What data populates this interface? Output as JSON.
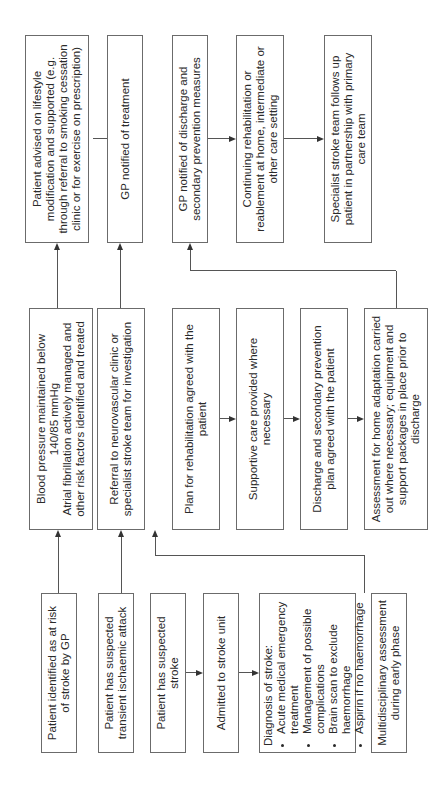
{
  "diagram": {
    "orientation": "rotated -90 degrees (text reads bottom-to-top)",
    "column_1": {
      "at_risk": "Patient identified as at risk of stroke by GP",
      "tia": "Patient has suspected transient ischaemic attack",
      "suspected_stroke": "Patient has suspected stroke",
      "admitted": "Admitted to stroke unit",
      "diagnosis": {
        "title": "Diagnosis of stroke:",
        "bullets": [
          "Acute medical emergency treatment",
          "Management of possible complications",
          "Brain scan to exclude haemorrhage",
          "Aspirin if no haemorrhage"
        ]
      },
      "mdt": "Multidisciplinary assessment during early phase"
    },
    "column_2": {
      "bp": {
        "line1": "Blood pressure maintained below 140/85 mmHg",
        "line2": "Atrial fibrillation actively managed and other risk factors identified and treated"
      },
      "referral": "Referral to neurovascular clinic or specialist stroke team for investigation",
      "rehab_plan": "Plan for rehabilitation agreed with the patient",
      "supportive": "Supportive care provided where necessary",
      "discharge_plan": "Discharge and secondary prevention plan agreed with the patient",
      "home_assessment": "Assessment for home adaptation carried out where necessary; equipment and support packages in place prior to discharge"
    },
    "column_3": {
      "lifestyle": "Patient advised on lifestyle modification and supported (e.g. through referral to smoking cessation clinic or for exercise on prescription)",
      "gp_treatment": "GP notified of treatment",
      "gp_discharge": "GP notified of discharge and secondary prevention measures",
      "continuing_rehab": "Continuing rehabilitation or reablement at home, intermediate or other care setting",
      "specialist_followup": "Specialist stroke team follows up patient in partnership with primary care team"
    }
  }
}
